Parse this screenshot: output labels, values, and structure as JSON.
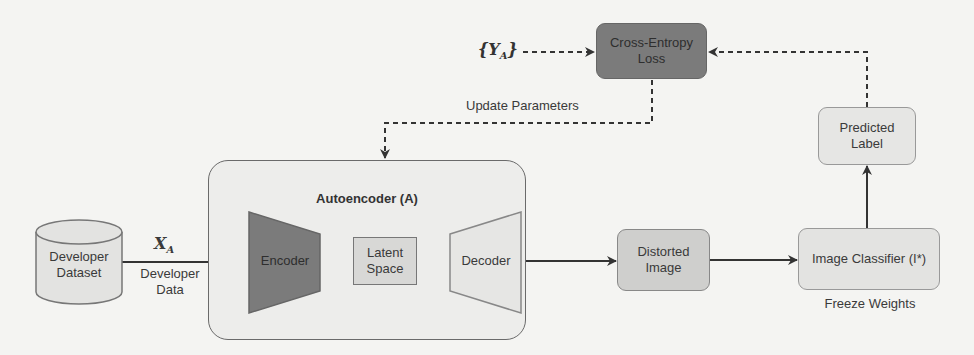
{
  "diagram": {
    "nodes": {
      "loss": {
        "label_line1": "Cross-Entropy",
        "label_line2": "Loss",
        "fill": "#7b7b7b"
      },
      "target": {
        "label": "{Y",
        "subscript": "A",
        "label_end": "}"
      },
      "dataset": {
        "label_line1": "Developer",
        "label_line2": "Dataset",
        "fill": "#e3e3e1"
      },
      "autoencoder": {
        "title": "Autoencoder (A)"
      },
      "encoder": {
        "label": "Encoder",
        "fill": "#7b7b7b"
      },
      "latent": {
        "label_line1": "Latent",
        "label_line2": "Space",
        "fill": "#d8d8d6"
      },
      "decoder": {
        "label": "Decoder",
        "fill": "#e6e6e4"
      },
      "distorted": {
        "label_line1": "Distorted",
        "label_line2": "Image",
        "fill": "#cfcfcd"
      },
      "classifier": {
        "label": "Image Classifier (I*)",
        "fill": "#e3e3e1"
      },
      "predicted": {
        "label_line1": "Predicted",
        "label_line2": "Label",
        "fill": "#e6e6e4"
      }
    },
    "edge_labels": {
      "input_symbol": "X",
      "input_subscript": "A",
      "input_line1": "Developer",
      "input_line2": "Data",
      "update": "Update Parameters",
      "freeze": "Freeze Weights"
    }
  }
}
